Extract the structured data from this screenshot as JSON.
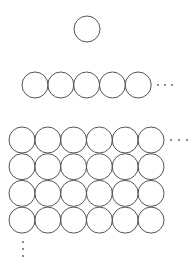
{
  "diagram": {
    "stroke_color": "#555555",
    "background": "#ffffff",
    "single": {
      "cx": 87,
      "cy": 29,
      "r": 13
    },
    "row": {
      "x0": 35,
      "cy": 85,
      "r": 13,
      "pitch": 25.8,
      "count": 5,
      "ellipsis": [
        {
          "cx": 158,
          "cy": 85
        },
        {
          "cx": 165,
          "cy": 85
        },
        {
          "cx": 172,
          "cy": 85
        }
      ]
    },
    "grid": {
      "x0": 22,
      "y0": 140,
      "r": 13,
      "pitch_x": 25.8,
      "pitch_y": 26.7,
      "cols": 6,
      "rows": 4,
      "ellipsis_h": [
        {
          "cx": 171,
          "cy": 140
        },
        {
          "cx": 179,
          "cy": 140
        },
        {
          "cx": 187,
          "cy": 140
        }
      ],
      "ellipsis_v": [
        {
          "cx": 23,
          "cy": 242
        },
        {
          "cx": 23,
          "cy": 249
        },
        {
          "cx": 23,
          "cy": 256
        }
      ]
    }
  }
}
